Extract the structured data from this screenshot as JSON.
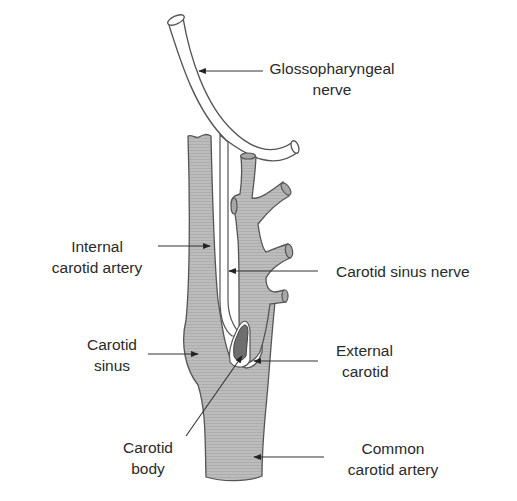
{
  "diagram": {
    "colors": {
      "vessel_fill": "#b9b9b9",
      "vessel_stroke": "#555555",
      "nerve_fill": "#ffffff",
      "carotid_body_fill": "#6e6e6e",
      "leader_line": "#333333",
      "text": "#2a2a2a",
      "background": "#ffffff"
    },
    "labels": {
      "glossopharyngeal": {
        "line1": "Glossopharyngeal",
        "line2": "nerve"
      },
      "internal_carotid": {
        "line1": "Internal",
        "line2": "carotid artery"
      },
      "carotid_sinus_nerve": {
        "line1": "Carotid sinus nerve"
      },
      "carotid_sinus": {
        "line1": "Carotid",
        "line2": "sinus"
      },
      "external_carotid": {
        "line1": "External",
        "line2": "carotid"
      },
      "carotid_body": {
        "line1": "Carotid",
        "line2": "body"
      },
      "common_carotid": {
        "line1": "Common",
        "line2": "carotid artery"
      }
    },
    "structures": [
      "glossopharyngeal-nerve",
      "carotid-sinus-nerve",
      "internal-carotid-artery",
      "external-carotid-artery",
      "carotid-sinus",
      "carotid-body",
      "common-carotid-artery"
    ]
  }
}
